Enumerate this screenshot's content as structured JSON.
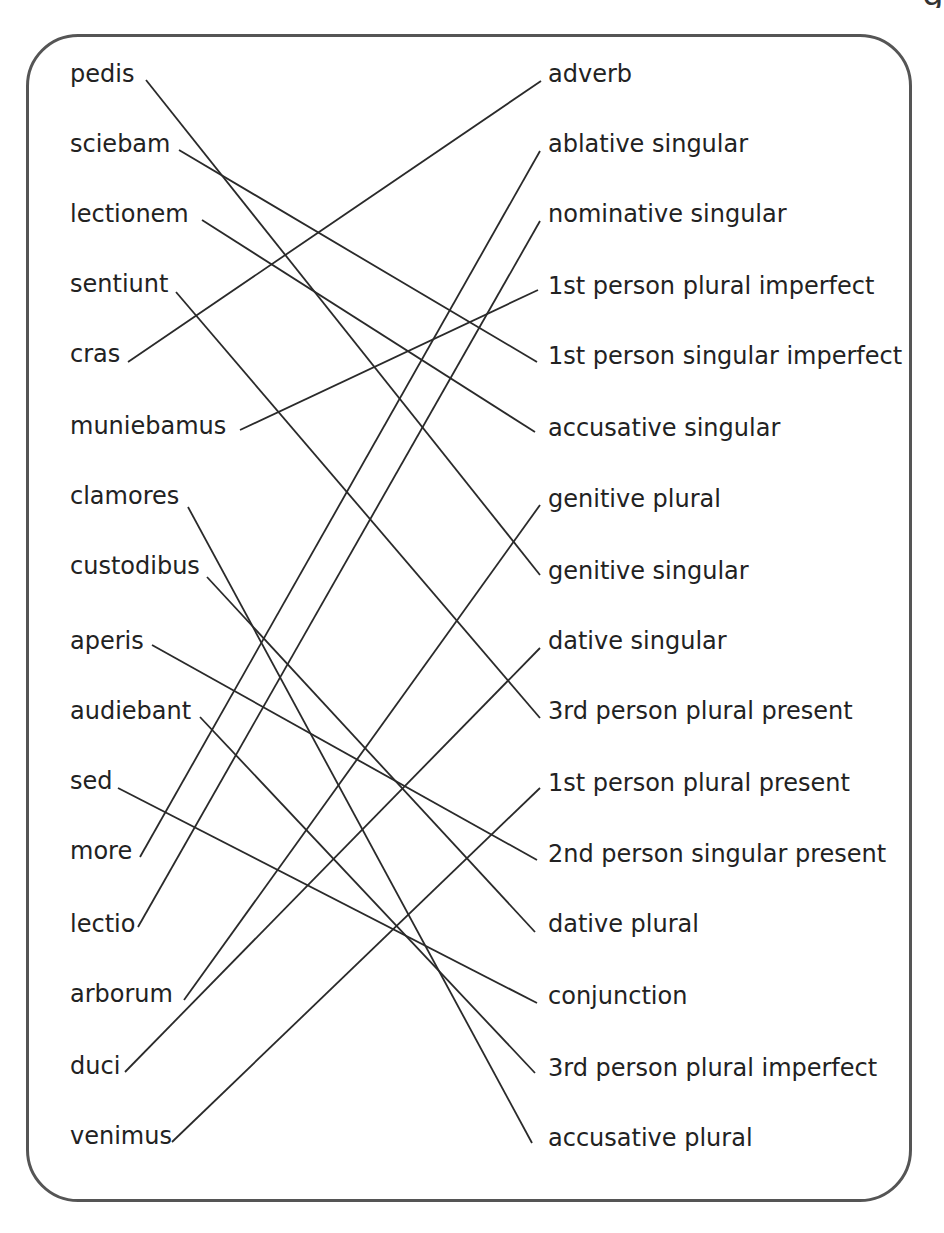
{
  "title_fragment": "g",
  "colors": {
    "frame": "#555555",
    "line": "#2a2a2a",
    "text": "#222222",
    "background": "#ffffff"
  },
  "left_column": [
    {
      "label": "pedis",
      "y": 78,
      "end_x": 146,
      "end_y": 80
    },
    {
      "label": "sciebam",
      "y": 148,
      "end_x": 179,
      "end_y": 150
    },
    {
      "label": "lectionem",
      "y": 218,
      "end_x": 202,
      "end_y": 220
    },
    {
      "label": "sentiunt",
      "y": 288,
      "end_x": 176,
      "end_y": 292
    },
    {
      "label": "cras",
      "y": 358,
      "end_x": 128,
      "end_y": 362
    },
    {
      "label": "muniebamus",
      "y": 430,
      "end_x": 240,
      "end_y": 430
    },
    {
      "label": "clamores",
      "y": 500,
      "end_x": 188,
      "end_y": 507
    },
    {
      "label": "custodibus",
      "y": 570,
      "end_x": 207,
      "end_y": 577
    },
    {
      "label": "aperis",
      "y": 645,
      "end_x": 152,
      "end_y": 645
    },
    {
      "label": "audiebant",
      "y": 715,
      "end_x": 200,
      "end_y": 717
    },
    {
      "label": "sed",
      "y": 785,
      "end_x": 118,
      "end_y": 788
    },
    {
      "label": "more",
      "y": 855,
      "end_x": 140,
      "end_y": 857
    },
    {
      "label": "lectio",
      "y": 928,
      "end_x": 138,
      "end_y": 927
    },
    {
      "label": "arborum",
      "y": 998,
      "end_x": 184,
      "end_y": 1000
    },
    {
      "label": "duci",
      "y": 1070,
      "end_x": 125,
      "end_y": 1072
    },
    {
      "label": "venimus",
      "y": 1140,
      "end_x": 172,
      "end_y": 1142
    }
  ],
  "right_column": [
    {
      "label": "adverb",
      "y": 78,
      "end_x": 541,
      "end_y": 81
    },
    {
      "label": "ablative singular",
      "y": 148,
      "end_x": 540,
      "end_y": 151
    },
    {
      "label": "nominative singular",
      "y": 218,
      "end_x": 540,
      "end_y": 221
    },
    {
      "label": "1st person plural imperfect",
      "y": 290,
      "end_x": 538,
      "end_y": 290
    },
    {
      "label": "1st person singular imperfect",
      "y": 360,
      "end_x": 537,
      "end_y": 362
    },
    {
      "label": "accusative singular",
      "y": 432,
      "end_x": 535,
      "end_y": 432
    },
    {
      "label": "genitive plural",
      "y": 503,
      "end_x": 540,
      "end_y": 505
    },
    {
      "label": "genitive singular",
      "y": 575,
      "end_x": 540,
      "end_y": 575
    },
    {
      "label": "dative singular",
      "y": 645,
      "end_x": 540,
      "end_y": 648
    },
    {
      "label": "3rd person plural present",
      "y": 715,
      "end_x": 540,
      "end_y": 718
    },
    {
      "label": "1st person plural present",
      "y": 787,
      "end_x": 540,
      "end_y": 788
    },
    {
      "label": "2nd person singular present",
      "y": 858,
      "end_x": 537,
      "end_y": 860
    },
    {
      "label": "dative plural",
      "y": 928,
      "end_x": 535,
      "end_y": 932
    },
    {
      "label": "conjunction",
      "y": 1000,
      "end_x": 537,
      "end_y": 1003
    },
    {
      "label": "3rd person plural imperfect",
      "y": 1072,
      "end_x": 535,
      "end_y": 1073
    },
    {
      "label": "accusative plural",
      "y": 1142,
      "end_x": 532,
      "end_y": 1143
    }
  ],
  "connections": [
    {
      "left": "pedis",
      "right": "genitive singular",
      "left_index": 0,
      "right_index": 7
    },
    {
      "left": "sciebam",
      "right": "1st person singular imperfect",
      "left_index": 1,
      "right_index": 4
    },
    {
      "left": "lectionem",
      "right": "accusative singular",
      "left_index": 2,
      "right_index": 5
    },
    {
      "left": "sentiunt",
      "right": "3rd person plural present",
      "left_index": 3,
      "right_index": 9
    },
    {
      "left": "cras",
      "right": "adverb",
      "left_index": 4,
      "right_index": 0
    },
    {
      "left": "muniebamus",
      "right": "1st person plural imperfect",
      "left_index": 5,
      "right_index": 3
    },
    {
      "left": "clamores",
      "right": "accusative plural",
      "left_index": 6,
      "right_index": 15
    },
    {
      "left": "custodibus",
      "right": "dative plural",
      "left_index": 7,
      "right_index": 12
    },
    {
      "left": "aperis",
      "right": "2nd person singular present",
      "left_index": 8,
      "right_index": 11
    },
    {
      "left": "audiebant",
      "right": "3rd person plural imperfect",
      "left_index": 9,
      "right_index": 14
    },
    {
      "left": "sed",
      "right": "conjunction",
      "left_index": 10,
      "right_index": 13
    },
    {
      "left": "more",
      "right": "ablative singular",
      "left_index": 11,
      "right_index": 1
    },
    {
      "left": "lectio",
      "right": "nominative singular",
      "left_index": 12,
      "right_index": 2
    },
    {
      "left": "arborum",
      "right": "genitive plural",
      "left_index": 13,
      "right_index": 6
    },
    {
      "left": "duci",
      "right": "dative singular",
      "left_index": 14,
      "right_index": 8
    },
    {
      "left": "venimus",
      "right": "1st person plural present",
      "left_index": 15,
      "right_index": 10
    }
  ]
}
